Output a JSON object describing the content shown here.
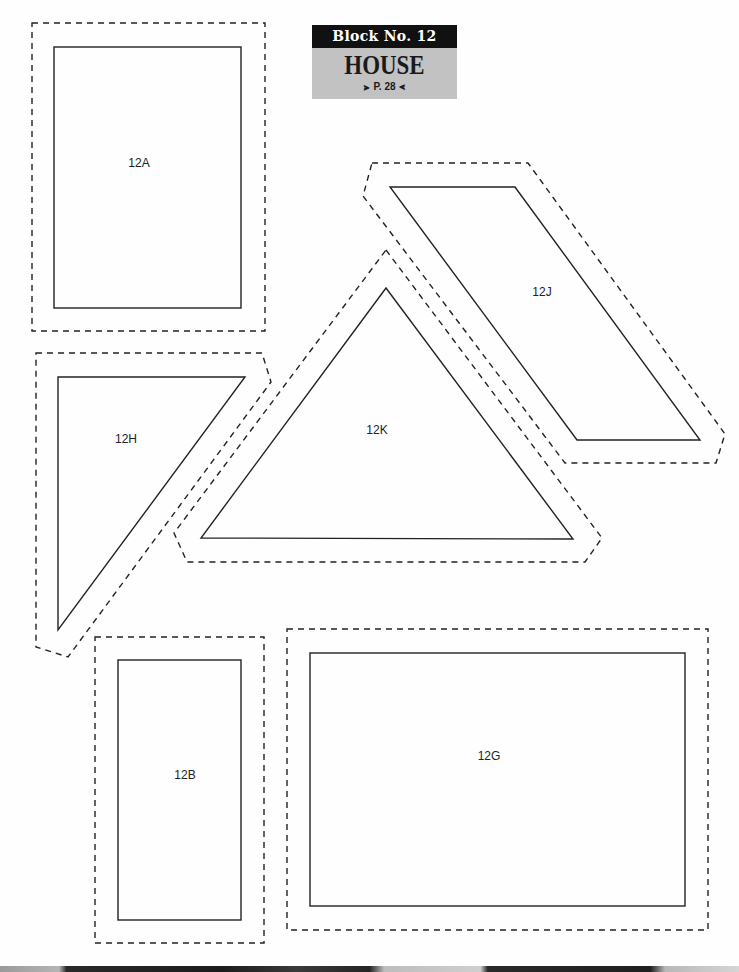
{
  "header": {
    "block_label": "Block No. 12",
    "title": "HOUSE",
    "page_ref": "P. 28",
    "ornament_left": "⪢",
    "ornament_right": "⪡"
  },
  "pieces": [
    {
      "id": "12A",
      "label": "12A",
      "shape": "rectangle"
    },
    {
      "id": "12J",
      "label": "12J",
      "shape": "parallelogram"
    },
    {
      "id": "12H",
      "label": "12H",
      "shape": "right-triangle"
    },
    {
      "id": "12K",
      "label": "12K",
      "shape": "triangle"
    },
    {
      "id": "12B",
      "label": "12B",
      "shape": "rectangle"
    },
    {
      "id": "12G",
      "label": "12G",
      "shape": "rectangle"
    }
  ],
  "colors": {
    "line": "#222222",
    "header_dark": "#111111",
    "header_gray": "#c2c2c2"
  }
}
